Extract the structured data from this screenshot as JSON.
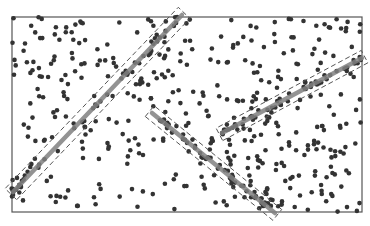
{
  "chart_data": {
    "type": "scatter",
    "title": "",
    "xlabel": "",
    "ylabel": "",
    "grid": false,
    "legend": null,
    "frame": {
      "x0": 12,
      "y0": 17,
      "x1": 362,
      "y1": 212
    },
    "colors": {
      "points": "#333333",
      "line": "#808080",
      "box": "#555555",
      "frame": "#555555"
    },
    "noise_points": {
      "count": 420,
      "seed": 7,
      "radius": 2.3
    },
    "detected_lines": [
      {
        "id": "line-1",
        "x1": 13,
        "y1": 192,
        "x2": 182,
        "y2": 15,
        "band_halfwidth": 8
      },
      {
        "id": "line-2",
        "x1": 152,
        "y1": 113,
        "x2": 275,
        "y2": 213,
        "band_halfwidth": 7
      },
      {
        "id": "line-3",
        "x1": 222,
        "y1": 133,
        "x2": 362,
        "y2": 58,
        "band_halfwidth": 7
      }
    ],
    "inlier_points_per_line": 40
  }
}
